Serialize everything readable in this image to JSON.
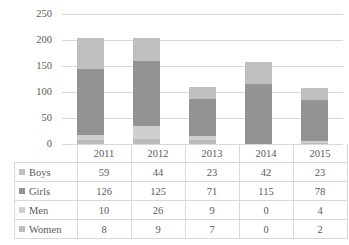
{
  "chart_data": {
    "type": "bar",
    "subtype": "stacked-column",
    "title": "",
    "xlabel": "",
    "ylabel": "",
    "categories": [
      "2011",
      "2012",
      "2013",
      "2014",
      "2015"
    ],
    "series": [
      {
        "name": "Boys",
        "values": [
          59,
          44,
          23,
          42,
          23
        ],
        "color": "#bfbfbf"
      },
      {
        "name": "Girls",
        "values": [
          126,
          125,
          71,
          115,
          78
        ],
        "color": "#939393"
      },
      {
        "name": "Men",
        "values": [
          10,
          26,
          9,
          0,
          4
        ],
        "color": "#cfcfcf"
      },
      {
        "name": "Women",
        "values": [
          8,
          9,
          7,
          0,
          2
        ],
        "color": "#bcbcbc"
      }
    ],
    "stack_order_bottom_to_top": [
      "Women",
      "Men",
      "Girls",
      "Boys"
    ],
    "ylim": [
      0,
      250
    ],
    "yticks": [
      0,
      50,
      100,
      150,
      200,
      250
    ],
    "ytick_labels": [
      "0",
      "50",
      "100",
      "150",
      "200",
      "250"
    ],
    "grid": true,
    "grid_color": "#d9d9d9",
    "legend_position": "data-table-left",
    "data_table_visible": true,
    "totals": [
      203,
      204,
      110,
      157,
      107
    ],
    "background": "#ffffff"
  },
  "table": {
    "corner_label": "",
    "columns": [
      "2011",
      "2012",
      "2013",
      "2014",
      "2015"
    ],
    "rows": [
      {
        "label": "Boys",
        "marker_color": "#bfbfbf",
        "values": [
          "59",
          "44",
          "23",
          "42",
          "23"
        ]
      },
      {
        "label": "Girls",
        "marker_color": "#939393",
        "values": [
          "126",
          "125",
          "71",
          "115",
          "78"
        ]
      },
      {
        "label": "Men",
        "marker_color": "#cfcfcf",
        "values": [
          "10",
          "26",
          "9",
          "0",
          "4"
        ]
      },
      {
        "label": "Women",
        "marker_color": "#bcbcbc",
        "values": [
          "8",
          "9",
          "7",
          "0",
          "2"
        ]
      }
    ]
  }
}
